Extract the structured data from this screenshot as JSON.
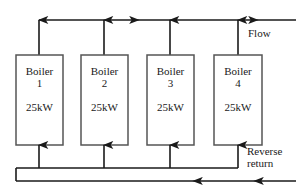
{
  "diagram": {
    "type": "piping-schematic",
    "colors": {
      "line": "#1a1a1a",
      "box_border": "#555555",
      "background": "#ffffff",
      "text": "#1a1a1a"
    },
    "boilers": [
      {
        "name": "Boiler",
        "index": "1",
        "rating": "25kW"
      },
      {
        "name": "Boiler",
        "index": "2",
        "rating": "25kW"
      },
      {
        "name": "Boiler",
        "index": "3",
        "rating": "25kW"
      },
      {
        "name": "Boiler",
        "index": "4",
        "rating": "25kW"
      }
    ],
    "labels": {
      "flow": "Flow",
      "reverse_return_line1": "Reverse",
      "reverse_return_line2": "return"
    }
  }
}
